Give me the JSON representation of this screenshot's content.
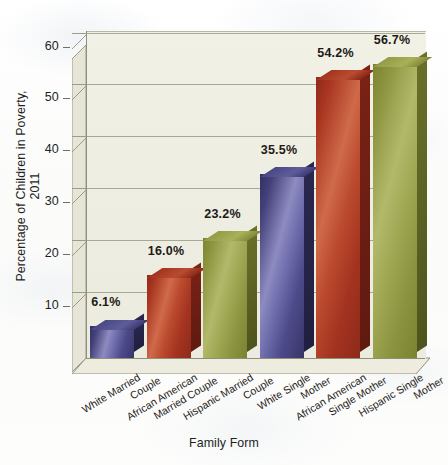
{
  "chart_data": {
    "type": "bar",
    "title": "",
    "xlabel": "Family Form",
    "ylabel": "Percentage of Children in Poverty, 2011",
    "ylim": [
      0,
      63
    ],
    "yticks": [
      10,
      20,
      30,
      40,
      50,
      60
    ],
    "ytick_labels": [
      "10",
      "20",
      "30",
      "40",
      "50",
      "60"
    ],
    "grid": true,
    "legend": "none",
    "style": "3d-bars",
    "categories": [
      "White Married Couple",
      "African American Married Couple",
      "Hispanic Married Couple",
      "White Single Mother",
      "African American Single Mother",
      "Hispanic Single Mother"
    ],
    "category_lines": [
      [
        "White Married",
        "Couple"
      ],
      [
        "African American",
        "Married Couple"
      ],
      [
        "Hispanic Married",
        "Couple"
      ],
      [
        "White Single",
        "Mother"
      ],
      [
        "African American",
        "Single Mother"
      ],
      [
        "Hispanic Single",
        "Mother"
      ]
    ],
    "values": [
      6.1,
      16.0,
      23.2,
      35.5,
      54.2,
      56.7
    ],
    "value_labels": [
      "6.1%",
      "16.0%",
      "23.2%",
      "35.5%",
      "54.2%",
      "56.7%"
    ],
    "bar_colors": [
      "#5a5a96",
      "#b13d2b",
      "#9aa345",
      "#5a5a96",
      "#b13d2b",
      "#9aa345"
    ],
    "color_names": [
      "purple",
      "red",
      "olive",
      "purple",
      "red",
      "olive"
    ]
  },
  "palette": {
    "purple": "#5a5a96",
    "red": "#b13d2b",
    "olive": "#9aa345",
    "plot_background": "#efeee2",
    "gridline": "#9b9c84",
    "text": "#1d1a18",
    "page_background": "#fdfdfc"
  }
}
